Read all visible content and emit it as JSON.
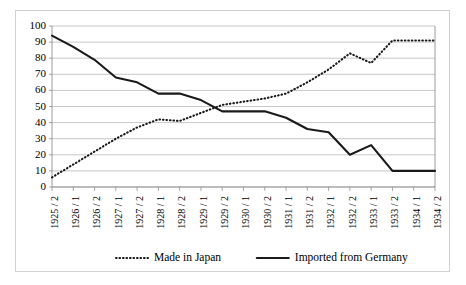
{
  "chart_data": {
    "type": "line",
    "title": "",
    "subtitle": "",
    "xlabel": "",
    "ylabel": "",
    "ylim": [
      0,
      100
    ],
    "ytick_step": 10,
    "yticks": [
      0,
      10,
      20,
      30,
      40,
      50,
      60,
      70,
      80,
      90,
      100
    ],
    "grid": true,
    "legend_position": "bottom",
    "categories": [
      "1925 / 2",
      "1926 / 1",
      "1926 / 2",
      "1927 / 1",
      "1927 / 2",
      "1928 / 1",
      "1928 / 2",
      "1929 / 1",
      "1929 / 2",
      "1930 / 1",
      "1930 / 2",
      "1931 / 1",
      "1931 / 2",
      "1932 / 1",
      "1932 / 2",
      "1933 / 1",
      "1933 / 2",
      "1934 / 1",
      "1934 / 2"
    ],
    "series": [
      {
        "name": "Made in Japan",
        "style": "dotted",
        "color": "#1a1a1a",
        "values": [
          6,
          14,
          22,
          30,
          37,
          42,
          41,
          46,
          51,
          53,
          55,
          58,
          65,
          73,
          83,
          77,
          91,
          91,
          91
        ]
      },
      {
        "name": "Imported from Germany",
        "style": "solid",
        "color": "#1a1a1a",
        "values": [
          94,
          87,
          79,
          68,
          65,
          58,
          58,
          54,
          47,
          47,
          47,
          43,
          36,
          34,
          20,
          26,
          10,
          10,
          10
        ]
      }
    ]
  },
  "legend": {
    "items": [
      {
        "label": "Made in Japan",
        "style": "dotted"
      },
      {
        "label": "Imported from Germany",
        "style": "solid"
      }
    ]
  }
}
